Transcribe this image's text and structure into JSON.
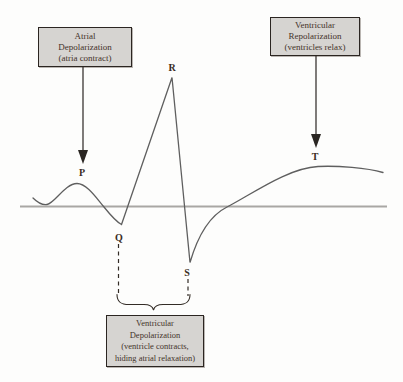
{
  "diagram": {
    "type": "ecg-waveform-annotated",
    "boxes": {
      "atrial_depolarization": {
        "lines": [
          "Atrial",
          "Depolarization",
          "(atria contract)"
        ]
      },
      "ventricular_repolarization": {
        "lines": [
          "Ventricular",
          "Repolarization",
          "(ventricles relax)"
        ]
      },
      "ventricular_depolarization": {
        "lines": [
          "Ventricular",
          "Depolarization",
          "(ventricle contracts,",
          "hiding atrial relaxation)"
        ]
      }
    },
    "wave_labels": {
      "p": "P",
      "q": "Q",
      "r": "R",
      "s": "S",
      "t": "T"
    },
    "colors": {
      "box_fill": "#d6d4d1",
      "box_border": "#2b2521",
      "text": "#44332a",
      "trace": "#5f5f5f",
      "baseline": "#a9a7a4",
      "arrow": "#2a2622"
    }
  }
}
